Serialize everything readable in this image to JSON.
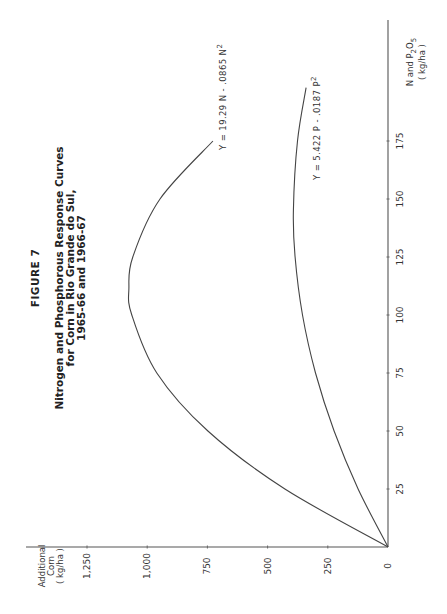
{
  "figure_label": "FIGURE 7",
  "title_lines": [
    "Nitrogen  and  Phosphorous  Response  Curves",
    "for  Corn  in  Rio  Grande  do  Sul,",
    "1965-66  and  1966-67"
  ],
  "axes": {
    "y_label_lines": [
      "Additional",
      "Corn",
      "( kg/ha )"
    ],
    "x_label_line1_main": "N  and  P",
    "x_label_sub2": "2",
    "x_label_o": "O",
    "x_label_sub5": "5",
    "x_label_line2": "( kg/ha )"
  },
  "equations": {
    "nitrogen": "Y = 19.29 N  -  .0865 N",
    "nitrogen_sup": "2",
    "phosphorus": "Y = 5.422 P  -  .0187 P",
    "phosphorus_sup": "2"
  },
  "chart_data": {
    "type": "line",
    "orientation": "rotated 90° counter-clockwise on page",
    "xlabel": "N and P2O5 (kg/ha)",
    "ylabel": "Additional Corn (kg/ha)",
    "x_ticks": [
      0,
      25,
      50,
      75,
      100,
      125,
      150,
      175
    ],
    "y_ticks": [
      0,
      250,
      500,
      750,
      1000,
      1250
    ],
    "y_tick_labels": [
      "0",
      "250",
      "500",
      "750",
      "1,000",
      "1,250"
    ],
    "xlim": [
      0,
      200
    ],
    "ylim": [
      0,
      1400
    ],
    "grid": false,
    "series": [
      {
        "name": "Nitrogen",
        "equation": "Y = 19.29 N - .0865 N^2",
        "x": [
          0,
          25,
          50,
          75,
          100,
          111.5,
          125,
          150,
          175
        ],
        "values": [
          0,
          428,
          748,
          960,
          1064,
          1076,
          1060,
          947,
          727
        ]
      },
      {
        "name": "Phosphorus",
        "equation": "Y = 5.422 P - .0187 P^2",
        "x": [
          0,
          25,
          50,
          75,
          100,
          125,
          145,
          175,
          198
        ],
        "values": [
          0,
          124,
          224,
          301,
          355,
          386,
          393,
          376,
          340
        ]
      }
    ]
  }
}
